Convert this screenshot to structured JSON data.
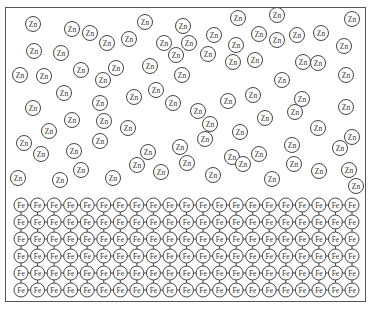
{
  "diagram": {
    "type": "atomic-lattice",
    "zinc": {
      "label": "Zn",
      "radius": 7.5,
      "atoms": [
        [
          33,
          24
        ],
        [
          72,
          29
        ],
        [
          90,
          33
        ],
        [
          107,
          43
        ],
        [
          129,
          39
        ],
        [
          145,
          22
        ],
        [
          183,
          26
        ],
        [
          164,
          43
        ],
        [
          189,
          43
        ],
        [
          214,
          35
        ],
        [
          238,
          18
        ],
        [
          277,
          15
        ],
        [
          277,
          40
        ],
        [
          259,
          34
        ],
        [
          236,
          45
        ],
        [
          297,
          35
        ],
        [
          321,
          33
        ],
        [
          352,
          19
        ],
        [
          303,
          62
        ],
        [
          344,
          46
        ],
        [
          34,
          51
        ],
        [
          61,
          53
        ],
        [
          20,
          75
        ],
        [
          44,
          76
        ],
        [
          81,
          70
        ],
        [
          116,
          68
        ],
        [
          103,
          80
        ],
        [
          150,
          66
        ],
        [
          176,
          55
        ],
        [
          208,
          54
        ],
        [
          233,
          62
        ],
        [
          255,
          60
        ],
        [
          282,
          80
        ],
        [
          318,
          63
        ],
        [
          346,
          75
        ],
        [
          64,
          93
        ],
        [
          100,
          103
        ],
        [
          33,
          108
        ],
        [
          72,
          120
        ],
        [
          49,
          131
        ],
        [
          104,
          121
        ],
        [
          134,
          97
        ],
        [
          156,
          90
        ],
        [
          182,
          75
        ],
        [
          173,
          103
        ],
        [
          198,
          111
        ],
        [
          210,
          124
        ],
        [
          228,
          101
        ],
        [
          253,
          95
        ],
        [
          265,
          118
        ],
        [
          240,
          132
        ],
        [
          302,
          99
        ],
        [
          318,
          128
        ],
        [
          346,
          107
        ],
        [
          24,
          143
        ],
        [
          41,
          154
        ],
        [
          74,
          151
        ],
        [
          100,
          141
        ],
        [
          128,
          128
        ],
        [
          148,
          152
        ],
        [
          180,
          147
        ],
        [
          205,
          139
        ],
        [
          232,
          157
        ],
        [
          259,
          154
        ],
        [
          295,
          112
        ],
        [
          292,
          145
        ],
        [
          340,
          148
        ],
        [
          352,
          137
        ],
        [
          18,
          178
        ],
        [
          60,
          180
        ],
        [
          81,
          170
        ],
        [
          113,
          178
        ],
        [
          137,
          165
        ],
        [
          161,
          172
        ],
        [
          187,
          163
        ],
        [
          213,
          175
        ],
        [
          243,
          164
        ],
        [
          272,
          179
        ],
        [
          294,
          164
        ],
        [
          319,
          171
        ],
        [
          349,
          170
        ],
        [
          356,
          186
        ]
      ]
    },
    "iron": {
      "label": "Fe",
      "radius": 7,
      "rows": 6,
      "cols": 21,
      "origin": [
        21,
        205
      ],
      "spacing": [
        16.55,
        17
      ]
    }
  }
}
